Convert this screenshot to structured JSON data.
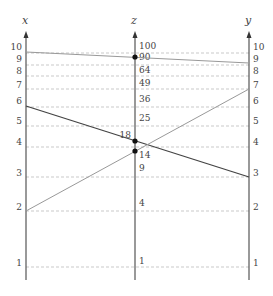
{
  "diagram": {
    "type": "nomogram",
    "relation": "z = x * y",
    "axes": {
      "x": {
        "label": "x",
        "ticks": [
          "10",
          "9",
          "8",
          "7",
          "6",
          "5",
          "4",
          "3",
          "2",
          "1"
        ]
      },
      "z": {
        "label": "z",
        "ticks": [
          "100",
          "81",
          "64",
          "49",
          "36",
          "25",
          "9",
          "4",
          "1"
        ]
      },
      "y": {
        "label": "y",
        "ticks": [
          "10",
          "9",
          "8",
          "7",
          "6",
          "5",
          "4",
          "3",
          "2",
          "1"
        ]
      }
    },
    "points": [
      {
        "axis": "z",
        "label": "90"
      },
      {
        "axis": "z",
        "label": "18"
      },
      {
        "axis": "z",
        "label": "14"
      }
    ],
    "lines": [
      {
        "from": "x=10",
        "to": "y=9",
        "through": "z=90",
        "style": "light"
      },
      {
        "from": "x=6",
        "to": "y=3",
        "through": "z=18",
        "style": "dark"
      },
      {
        "from": "x=2",
        "to": "y=7",
        "through": "z=14",
        "style": "light"
      }
    ],
    "colors": {
      "axis": "#555555",
      "grid": "#bbbbbb",
      "dark_line": "#444444",
      "light_line": "#999999",
      "point": "#111111"
    }
  }
}
